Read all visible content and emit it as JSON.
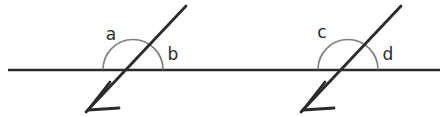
{
  "figure": {
    "type": "geometry-diagram",
    "background_color": "#ffffff",
    "line_color": "#2b2b2b",
    "arc_color": "#808080",
    "label_color": "#2b2b2b"
  },
  "horizontal_line": {
    "name": "horizontal-line",
    "x1": 8,
    "y1": 70,
    "x2": 440,
    "y2": 70,
    "stroke_width": 2.6
  },
  "intersections": [
    {
      "id": "left",
      "center_x": 133,
      "center_y": 70,
      "arc_radius": 30,
      "transversal": {
        "name": "transversal-line-left",
        "x1": 86,
        "y1": 112,
        "x2": 186,
        "y2": 6,
        "stroke_width": 2.8
      },
      "arrowhead": {
        "name": "arrowhead-left",
        "tip_x": 88,
        "tip_y": 110,
        "direction": "down-left"
      },
      "labels": [
        {
          "text": "a",
          "x": 111,
          "y": 35
        },
        {
          "text": "b",
          "x": 173,
          "y": 55
        }
      ]
    },
    {
      "id": "right",
      "center_x": 348,
      "center_y": 70,
      "arc_radius": 30,
      "transversal": {
        "name": "transversal-line-right",
        "x1": 301,
        "y1": 112,
        "x2": 401,
        "y2": 6,
        "stroke_width": 2.8
      },
      "arrowhead": {
        "name": "arrowhead-right",
        "tip_x": 303,
        "tip_y": 110,
        "direction": "down-left"
      },
      "labels": [
        {
          "text": "c",
          "x": 322,
          "y": 33
        },
        {
          "text": "d",
          "x": 388,
          "y": 55
        }
      ]
    }
  ],
  "labels": {
    "left_obtuse": "a",
    "left_acute": "b",
    "right_obtuse": "c",
    "right_acute": "d"
  }
}
